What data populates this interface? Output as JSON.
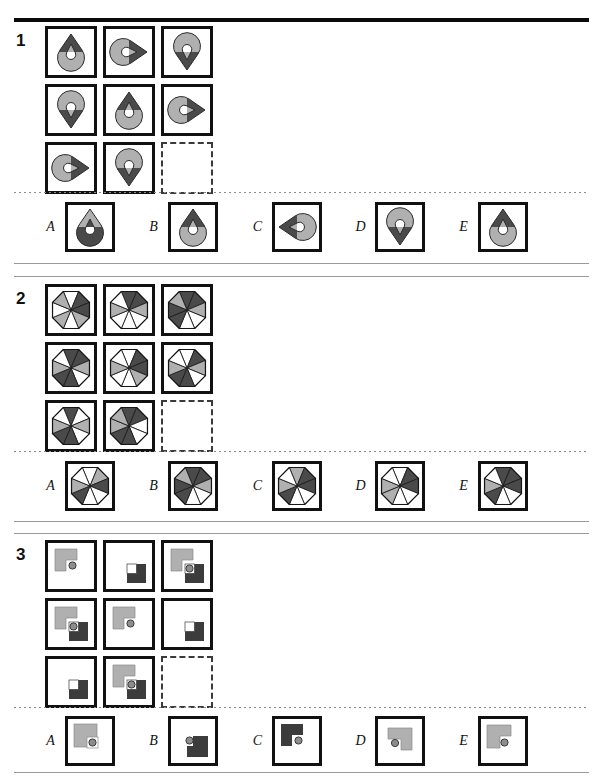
{
  "page": {
    "kind": "matrix-reasoning-test",
    "width": 603,
    "height": 776,
    "colors": {
      "dark": "#4a4a4a",
      "darker": "#3c3c3c",
      "light": "#b0b0b0",
      "white": "#ffffff",
      "outline": "#111111",
      "rule": "#9a9a9a"
    }
  },
  "puzzles": [
    {
      "number": "1",
      "shape_kind": "teardrop",
      "matrix": [
        {
          "cell": "r1c1",
          "rotation": 0,
          "top_fill": "dark",
          "bottom_fill": "light",
          "blank": false
        },
        {
          "cell": "r1c2",
          "rotation": 90,
          "top_fill": "dark",
          "bottom_fill": "light",
          "blank": false
        },
        {
          "cell": "r1c3",
          "rotation": 180,
          "top_fill": "dark",
          "bottom_fill": "light",
          "blank": false
        },
        {
          "cell": "r2c1",
          "rotation": 180,
          "top_fill": "dark",
          "bottom_fill": "light",
          "blank": false
        },
        {
          "cell": "r2c2",
          "rotation": 0,
          "top_fill": "dark",
          "bottom_fill": "light",
          "blank": false
        },
        {
          "cell": "r2c3",
          "rotation": 90,
          "top_fill": "dark",
          "bottom_fill": "light",
          "blank": false
        },
        {
          "cell": "r3c1",
          "rotation": 90,
          "top_fill": "dark",
          "bottom_fill": "light",
          "blank": false
        },
        {
          "cell": "r3c2",
          "rotation": 180,
          "top_fill": "dark",
          "bottom_fill": "light",
          "blank": false
        },
        {
          "cell": "r3c3",
          "rotation": 0,
          "top_fill": "dark",
          "bottom_fill": "light",
          "blank": true
        }
      ],
      "options": [
        {
          "letter": "A",
          "rotation": 0,
          "top_fill": "light",
          "bottom_fill": "dark"
        },
        {
          "letter": "B",
          "rotation": 0,
          "top_fill": "dark",
          "bottom_fill": "light"
        },
        {
          "letter": "C",
          "rotation": 270,
          "top_fill": "dark",
          "bottom_fill": "light"
        },
        {
          "letter": "D",
          "rotation": 180,
          "top_fill": "dark",
          "bottom_fill": "light"
        },
        {
          "letter": "E",
          "rotation": 0,
          "top_fill": "dark",
          "bottom_fill": "light"
        }
      ]
    },
    {
      "number": "2",
      "shape_kind": "octagon-wedges",
      "matrix": [
        {
          "cell": "r1c1",
          "wedges": [
            "white",
            "dark",
            "dark",
            "light",
            "white",
            "light",
            "white",
            "light"
          ],
          "blank": false
        },
        {
          "cell": "r1c2",
          "wedges": [
            "dark",
            "dark",
            "light",
            "white",
            "white",
            "white",
            "light",
            "white"
          ],
          "blank": false
        },
        {
          "cell": "r1c3",
          "wedges": [
            "dark",
            "dark",
            "light",
            "white",
            "white",
            "dark",
            "dark",
            "light"
          ],
          "blank": false
        },
        {
          "cell": "r2c1",
          "wedges": [
            "dark",
            "dark",
            "light",
            "white",
            "dark",
            "dark",
            "light",
            "white"
          ],
          "blank": false
        },
        {
          "cell": "r2c2",
          "wedges": [
            "white",
            "dark",
            "dark",
            "light",
            "white",
            "white",
            "light",
            "white"
          ],
          "blank": false
        },
        {
          "cell": "r2c3",
          "wedges": [
            "white",
            "dark",
            "light",
            "white",
            "dark",
            "dark",
            "light",
            "white"
          ],
          "blank": false
        },
        {
          "cell": "r3c1",
          "wedges": [
            "dark",
            "white",
            "light",
            "white",
            "dark",
            "dark",
            "light",
            "white"
          ],
          "blank": false
        },
        {
          "cell": "r3c2",
          "wedges": [
            "dark",
            "dark",
            "white",
            "white",
            "dark",
            "dark",
            "light",
            "light"
          ],
          "blank": false
        },
        {
          "cell": "r3c3",
          "wedges": [
            "white",
            "white",
            "white",
            "white",
            "white",
            "white",
            "white",
            "white"
          ],
          "blank": true
        }
      ],
      "options": [
        {
          "letter": "A",
          "wedges": [
            "white",
            "light",
            "dark",
            "white",
            "white",
            "dark",
            "light",
            "white"
          ]
        },
        {
          "letter": "B",
          "wedges": [
            "dark",
            "dark",
            "light",
            "white",
            "white",
            "dark",
            "dark",
            "light"
          ]
        },
        {
          "letter": "C",
          "wedges": [
            "light",
            "dark",
            "dark",
            "white",
            "white",
            "dark",
            "light",
            "white"
          ]
        },
        {
          "letter": "D",
          "wedges": [
            "white",
            "dark",
            "dark",
            "white",
            "white",
            "light",
            "light",
            "white"
          ]
        },
        {
          "letter": "E",
          "wedges": [
            "dark",
            "dark",
            "dark",
            "white",
            "white",
            "dark",
            "light",
            "white"
          ]
        }
      ]
    },
    {
      "number": "3",
      "shape_kind": "squares-and-dot",
      "matrix": [
        {
          "cell": "r1c1",
          "gray_lshape": true,
          "dark_square": false,
          "white_notch": false,
          "dot": true,
          "dot_pos": "inner",
          "blank": false
        },
        {
          "cell": "r1c2",
          "gray_lshape": false,
          "dark_square": true,
          "white_notch": true,
          "dot": false,
          "dot_pos": "none",
          "blank": false
        },
        {
          "cell": "r1c3",
          "gray_lshape": true,
          "dark_square": true,
          "white_notch": true,
          "dot": true,
          "dot_pos": "center",
          "blank": false
        },
        {
          "cell": "r2c1",
          "gray_lshape": true,
          "dark_square": true,
          "white_notch": true,
          "dot": true,
          "dot_pos": "center",
          "blank": false
        },
        {
          "cell": "r2c2",
          "gray_lshape": true,
          "dark_square": false,
          "white_notch": false,
          "dot": true,
          "dot_pos": "inner",
          "blank": false
        },
        {
          "cell": "r2c3",
          "gray_lshape": false,
          "dark_square": true,
          "white_notch": true,
          "dot": false,
          "dot_pos": "none",
          "blank": false
        },
        {
          "cell": "r3c1",
          "gray_lshape": false,
          "dark_square": true,
          "white_notch": true,
          "dot": false,
          "dot_pos": "none",
          "blank": false
        },
        {
          "cell": "r3c2",
          "gray_lshape": true,
          "dark_square": true,
          "white_notch": true,
          "dot": true,
          "dot_pos": "center",
          "blank": false
        },
        {
          "cell": "r3c3",
          "gray_lshape": false,
          "dark_square": false,
          "white_notch": false,
          "dot": false,
          "dot_pos": "none",
          "blank": true
        }
      ],
      "options": [
        {
          "letter": "A",
          "variant": "gray-square-dot-white"
        },
        {
          "letter": "B",
          "variant": "dark-step-dot-left"
        },
        {
          "letter": "C",
          "variant": "dark-lshape-dot"
        },
        {
          "letter": "D",
          "variant": "gray-lshape-dot-left"
        },
        {
          "letter": "E",
          "variant": "gray-lshape-dot-inner"
        }
      ]
    }
  ]
}
